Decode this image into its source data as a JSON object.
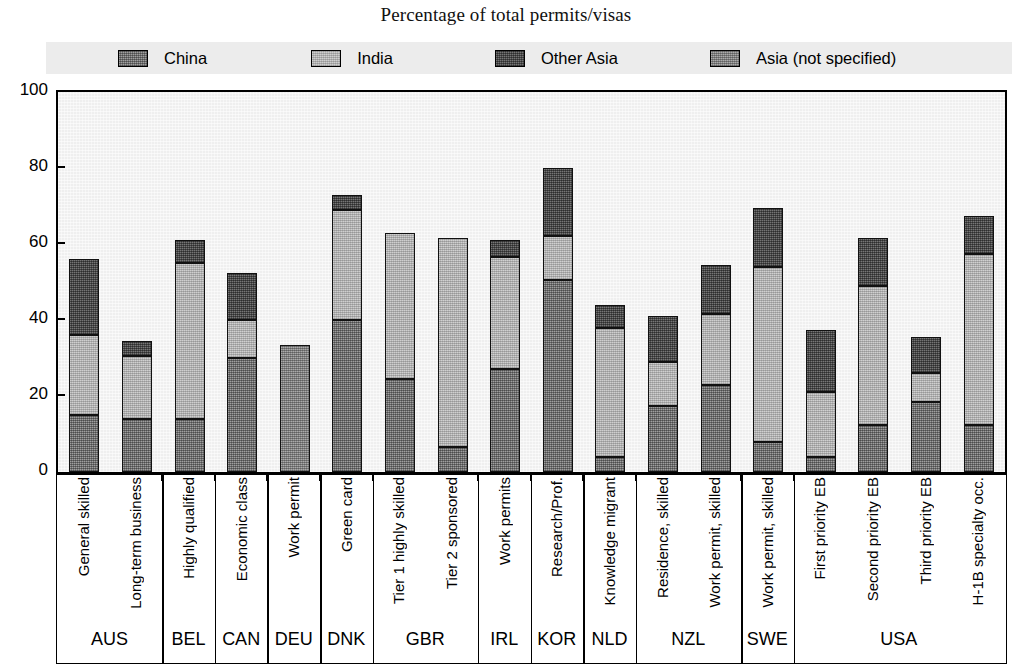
{
  "title": "Percentage of total permits/visas",
  "legend": {
    "position": "top",
    "items": [
      {
        "label": "China",
        "key": "china",
        "swatch": "medium-gray-hatch"
      },
      {
        "label": "India",
        "key": "india",
        "swatch": "light-gray-hatch"
      },
      {
        "label": "Other Asia",
        "key": "other_asia",
        "swatch": "dark-gray-hatch"
      },
      {
        "label": "Asia (not specified)",
        "key": "asia_not_specified",
        "swatch": "mid-gray-hatch"
      }
    ]
  },
  "yaxis": {
    "label": "",
    "min": 0,
    "max": 100,
    "ticks": [
      "0",
      "20",
      "40",
      "60",
      "80",
      "100"
    ]
  },
  "chart_data": {
    "type": "bar",
    "title": "Percentage of total permits/visas",
    "xlabel": "",
    "ylabel": "",
    "ylim": [
      0,
      100
    ],
    "grid": false,
    "stacked": true,
    "legend_position": "top",
    "series": [
      {
        "name": "China",
        "key": "china"
      },
      {
        "name": "India",
        "key": "india"
      },
      {
        "name": "Other Asia",
        "key": "other_asia"
      },
      {
        "name": "Asia (not specified)",
        "key": "asia_not_specified"
      }
    ],
    "groups": [
      {
        "country": "AUS",
        "categories": [
          {
            "label": "General skilled",
            "china": 15,
            "india": 21,
            "other_asia": 20,
            "asia_not_specified": 0,
            "total": 56
          },
          {
            "label": "Long-term business",
            "china": 14,
            "india": 16.5,
            "other_asia": 4,
            "asia_not_specified": 0,
            "total": 34.5
          }
        ]
      },
      {
        "country": "BEL",
        "categories": [
          {
            "label": "Highly qualified",
            "china": 14,
            "india": 41,
            "other_asia": 6,
            "asia_not_specified": 0,
            "total": 61
          }
        ]
      },
      {
        "country": "CAN",
        "categories": [
          {
            "label": "Economic class",
            "china": 30,
            "india": 10,
            "other_asia": 12.5,
            "asia_not_specified": 0,
            "total": 52.5
          }
        ]
      },
      {
        "country": "DEU",
        "categories": [
          {
            "label": "Work permit",
            "china": 0,
            "india": 0,
            "other_asia": 0,
            "asia_not_specified": 33.5,
            "total": 33.5
          }
        ]
      },
      {
        "country": "DNK",
        "categories": [
          {
            "label": "Green card",
            "china": 40,
            "india": 29,
            "other_asia": 4,
            "asia_not_specified": 0,
            "total": 73
          }
        ]
      },
      {
        "country": "GBR",
        "categories": [
          {
            "label": "Tier 1 highly skilled",
            "china": 24.5,
            "india": 38.5,
            "other_asia": 0,
            "asia_not_specified": 0,
            "total": 63
          },
          {
            "label": "Tier 2 sponsored",
            "china": 6.5,
            "india": 55,
            "other_asia": 0,
            "asia_not_specified": 0,
            "total": 61.5
          }
        ]
      },
      {
        "country": "IRL",
        "categories": [
          {
            "label": "Work permits",
            "china": 27,
            "india": 29.5,
            "other_asia": 4.5,
            "asia_not_specified": 0,
            "total": 61
          }
        ]
      },
      {
        "country": "KOR",
        "categories": [
          {
            "label": "Research/Prof.",
            "china": 50.5,
            "india": 11.5,
            "other_asia": 18,
            "asia_not_specified": 0,
            "total": 80
          }
        ]
      },
      {
        "country": "NLD",
        "categories": [
          {
            "label": "Knowledge migrant",
            "china": 4,
            "india": 34,
            "other_asia": 6,
            "asia_not_specified": 0,
            "total": 44
          }
        ]
      },
      {
        "country": "NZL",
        "categories": [
          {
            "label": "Residence, skilled",
            "china": 17.5,
            "india": 11.5,
            "other_asia": 12,
            "asia_not_specified": 0,
            "total": 41
          },
          {
            "label": "Work permit, skilled",
            "china": 23,
            "india": 18.5,
            "other_asia": 13,
            "asia_not_specified": 0,
            "total": 54.5
          }
        ]
      },
      {
        "country": "SWE",
        "categories": [
          {
            "label": "Work permit, skilled",
            "china": 8,
            "india": 46,
            "other_asia": 15.5,
            "asia_not_specified": 0,
            "total": 69.5
          }
        ]
      },
      {
        "country": "USA",
        "categories": [
          {
            "label": "First priority EB",
            "china": 4,
            "india": 17,
            "other_asia": 16.5,
            "asia_not_specified": 0,
            "total": 37.5
          },
          {
            "label": "Second priority EB",
            "china": 12.5,
            "india": 36.5,
            "other_asia": 12.5,
            "asia_not_specified": 0,
            "total": 61.5
          },
          {
            "label": "Third priority EB",
            "china": 18.5,
            "india": 7.5,
            "other_asia": 9.5,
            "asia_not_specified": 0,
            "total": 35.5
          },
          {
            "label": "H-1B specialty occ.",
            "china": 12.5,
            "india": 45,
            "other_asia": 10,
            "asia_not_specified": 0,
            "total": 67.5
          }
        ]
      }
    ]
  },
  "colors": {
    "china": "#757575",
    "india": "#b9b9b9",
    "other_asia": "#4f4f4f",
    "asia_not_specified": "#8a8a8a",
    "plot_background": "#efefef",
    "legend_background": "#ececec",
    "axis": "#000000"
  }
}
